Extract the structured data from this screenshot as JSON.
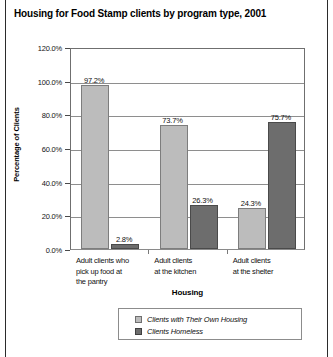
{
  "chart_data": {
    "type": "bar",
    "title": "Housing for Food Stamp clients by program type, 2001",
    "xlabel": "Housing",
    "ylabel": "Percentage of Clients",
    "ylim": [
      0,
      120
    ],
    "ytick_labels": [
      "120.0%",
      "100.0%",
      "80.0%",
      "60.0%",
      "40.0%",
      "20.0%",
      "0.0%"
    ],
    "ytick_values": [
      120,
      100,
      80,
      60,
      40,
      20,
      0
    ],
    "grid": true,
    "legend_position": "bottom",
    "categories": [
      "Adult clients who pick up food at the pantry",
      "Adult clients at the kitchen",
      "Adult clients at the shelter"
    ],
    "category_lines": [
      [
        "Adult clients who",
        "pick up food at",
        "the pantry"
      ],
      [
        "Adult clients",
        "at the kitchen"
      ],
      [
        "Adult clients",
        "at the shelter"
      ]
    ],
    "series": [
      {
        "name": "Clients with Their Own Housing",
        "color": "#bcbcbc",
        "values": [
          97.2,
          73.7,
          24.3
        ],
        "labels": [
          "97.2%",
          "73.7%",
          "24.3%"
        ]
      },
      {
        "name": "Clients Homeless",
        "color": "#6d6d6d",
        "values": [
          2.8,
          26.3,
          75.7
        ],
        "labels": [
          "2.8%",
          "26.3%",
          "75.7%"
        ]
      }
    ]
  },
  "legend": {
    "items": [
      {
        "label": "Clients with Their Own Housing",
        "color": "#bcbcbc"
      },
      {
        "label": "Clients Homeless",
        "color": "#6d6d6d"
      }
    ]
  }
}
